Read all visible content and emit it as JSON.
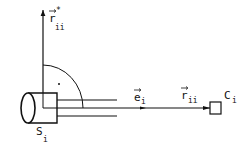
{
  "diagram": {
    "labels": {
      "r_star": {
        "base": "r",
        "sup": "*",
        "sub": "ii"
      },
      "e_i": {
        "base": "e",
        "sub": "i"
      },
      "r_ii": {
        "base": "r",
        "sub": "ii"
      },
      "c_i": {
        "base": "C",
        "sub": "i"
      },
      "s_i": {
        "base": "S",
        "sub": "i"
      }
    },
    "colors": {
      "stroke": "#111111",
      "background": "#ffffff"
    }
  }
}
